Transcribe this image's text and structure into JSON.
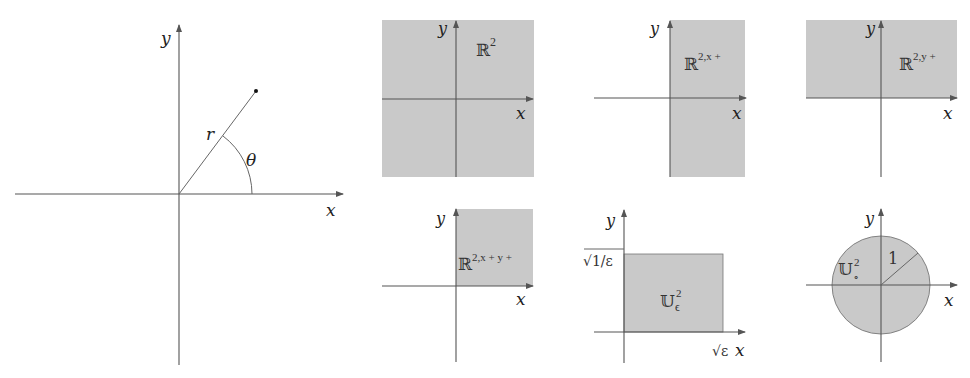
{
  "figure": {
    "colors": {
      "region": "#c9c9c9",
      "axis": "#555555",
      "text": "#222222",
      "background": "#ffffff"
    }
  },
  "panels": {
    "polar": {
      "x_label": "x",
      "y_label": "y",
      "radius_label": "r",
      "angle_label": "θ"
    },
    "r2": {
      "x_label": "x",
      "y_label": "y",
      "set_symbol": "ℝ",
      "set_superscript": "2"
    },
    "r2_xplus": {
      "x_label": "x",
      "y_label": "y",
      "set_symbol": "ℝ",
      "set_superscript": "2,x +"
    },
    "r2_yplus": {
      "x_label": "x",
      "y_label": "y",
      "set_symbol": "ℝ",
      "set_superscript": "2,y +"
    },
    "r2_xplus_yplus": {
      "x_label": "x",
      "y_label": "y",
      "set_symbol": "ℝ",
      "set_superscript": "2,x + y +"
    },
    "u2_epsilon": {
      "x_label": "x",
      "y_label": "y",
      "x_tick": "√ε",
      "y_tick": "√1/ε",
      "set_symbol": "𝕌",
      "set_superscript": "2",
      "set_subscript": "ϵ"
    },
    "u2_disk": {
      "x_label": "x",
      "y_label": "y",
      "radius_label": "1",
      "set_symbol": "𝕌",
      "set_superscript": "2",
      "set_subscript": "∘"
    }
  }
}
